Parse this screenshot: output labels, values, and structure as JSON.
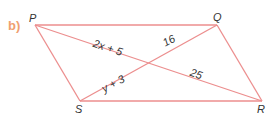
{
  "part_label": "b)",
  "vertices": {
    "P": {
      "label": "P",
      "x": 35,
      "y": 25
    },
    "Q": {
      "label": "Q",
      "x": 217,
      "y": 25
    },
    "S": {
      "label": "S",
      "x": 80,
      "y": 101
    },
    "R": {
      "label": "R",
      "x": 262,
      "y": 101
    }
  },
  "segment_labels": {
    "pm": "2x + 5",
    "qm": "16",
    "sm": "y + 3",
    "mr": "25"
  },
  "colors": {
    "line": "#ec8e8e",
    "part_label": "#f0a070",
    "text": "#333333"
  }
}
